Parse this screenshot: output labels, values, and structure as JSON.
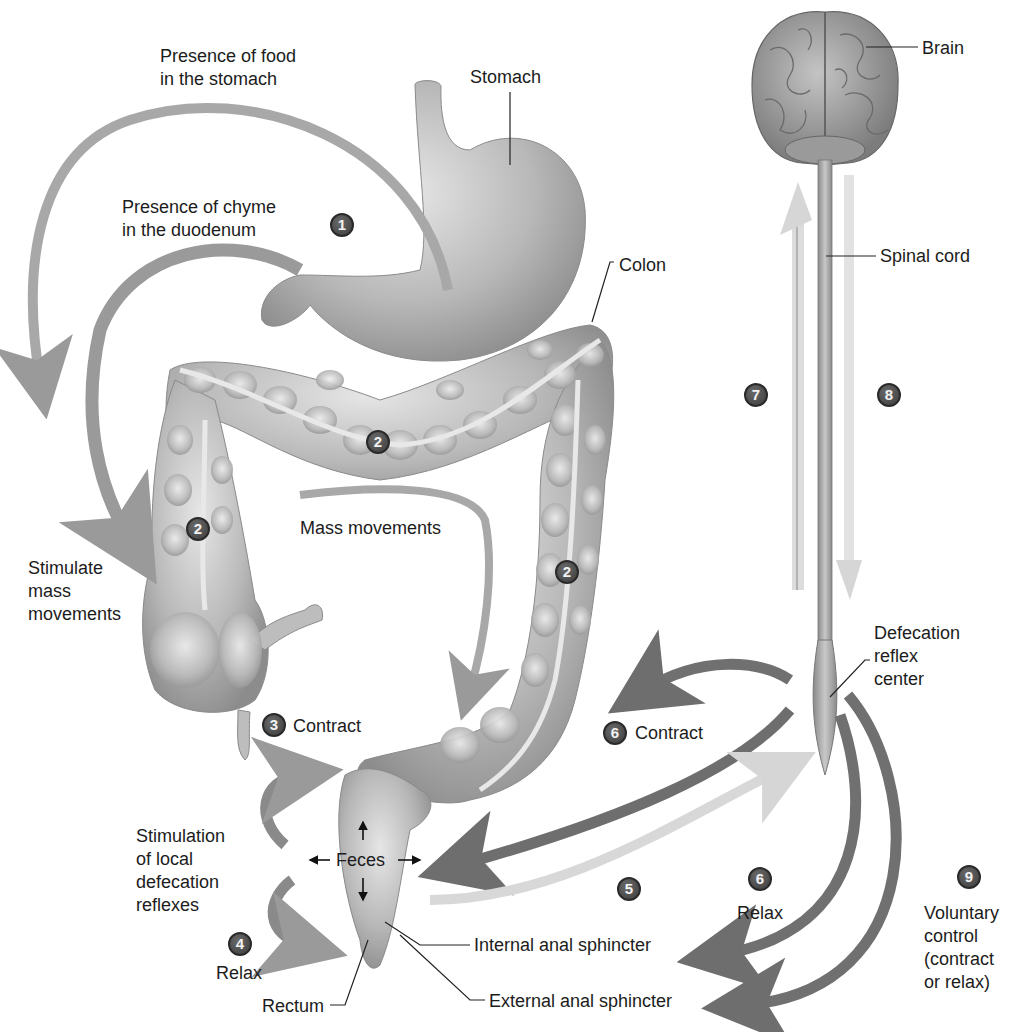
{
  "figure": {
    "title": "Defecation reflex",
    "structures": {
      "stomach": "Stomach",
      "colon": "Colon",
      "brain": "Brain",
      "spinal_cord": "Spinal cord",
      "reflex_center": [
        "Defecation",
        "reflex",
        "center"
      ],
      "rectum": "Rectum",
      "internal_sphincter": "Internal anal sphincter",
      "external_sphincter": "External anal sphincter",
      "feces": "Feces"
    },
    "annotations": {
      "food_stomach": [
        "Presence of food",
        "in the stomach"
      ],
      "chyme_duodenum": [
        "Presence of chyme",
        "in the duodenum"
      ],
      "stimulate_mass": [
        "Stimulate",
        "mass",
        "movements"
      ],
      "mass_movements": "Mass movements",
      "contract_3": "Contract",
      "contract_6": "Contract",
      "stim_local": [
        "Stimulation",
        "of local",
        "defecation",
        "reflexes"
      ],
      "relax_4": "Relax",
      "relax_6": "Relax",
      "voluntary": [
        "Voluntary",
        "control",
        "(contract",
        "or relax)"
      ]
    },
    "steps": [
      {
        "id": "step-1",
        "number": "1"
      },
      {
        "id": "step-2a",
        "number": "2"
      },
      {
        "id": "step-2b",
        "number": "2"
      },
      {
        "id": "step-2c",
        "number": "2"
      },
      {
        "id": "step-3",
        "number": "3"
      },
      {
        "id": "step-4",
        "number": "4"
      },
      {
        "id": "step-5",
        "number": "5"
      },
      {
        "id": "step-6a",
        "number": "6"
      },
      {
        "id": "step-6b",
        "number": "6"
      },
      {
        "id": "step-7",
        "number": "7"
      },
      {
        "id": "step-8",
        "number": "8"
      },
      {
        "id": "step-9",
        "number": "9"
      }
    ],
    "colors": {
      "organ_gray": "#b5b5b5",
      "arrow_dark": "#6e6e6e",
      "arrow_mid": "#9a9a9a",
      "arrow_light": "#d8d8d8",
      "badge": "#4a4a4a"
    }
  }
}
